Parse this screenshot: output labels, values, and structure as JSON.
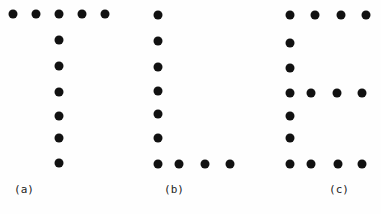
{
  "figure": {
    "dot_color": "#111111",
    "dot_diameter": 9,
    "panels": [
      {
        "id": "a",
        "letter": "T",
        "label": "(a)",
        "label_pos": [
          24,
          189
        ],
        "dots": [
          [
            13,
            14
          ],
          [
            36,
            14
          ],
          [
            59,
            14
          ],
          [
            82,
            14
          ],
          [
            105,
            14
          ],
          [
            59,
            40
          ],
          [
            59,
            66
          ],
          [
            59,
            92
          ],
          [
            59,
            116
          ],
          [
            59,
            138
          ],
          [
            59,
            163
          ]
        ]
      },
      {
        "id": "b",
        "letter": "L",
        "label": "(b)",
        "label_pos": [
          174,
          189
        ],
        "dots": [
          [
            158,
            15
          ],
          [
            158,
            41
          ],
          [
            158,
            67
          ],
          [
            158,
            91
          ],
          [
            158,
            114
          ],
          [
            158,
            138
          ],
          [
            158,
            164
          ],
          [
            179,
            164
          ],
          [
            205,
            164
          ],
          [
            230,
            164
          ]
        ]
      },
      {
        "id": "c",
        "letter": "E",
        "label": "(c)",
        "label_pos": [
          339,
          189
        ],
        "dots": [
          [
            290,
            15
          ],
          [
            315,
            15
          ],
          [
            341,
            15
          ],
          [
            366,
            15
          ],
          [
            290,
            43
          ],
          [
            290,
            68
          ],
          [
            290,
            93
          ],
          [
            311,
            93
          ],
          [
            337,
            93
          ],
          [
            362,
            93
          ],
          [
            290,
            116
          ],
          [
            290,
            138
          ],
          [
            290,
            164
          ],
          [
            311,
            164
          ],
          [
            338,
            164
          ],
          [
            362,
            164
          ]
        ]
      }
    ]
  }
}
